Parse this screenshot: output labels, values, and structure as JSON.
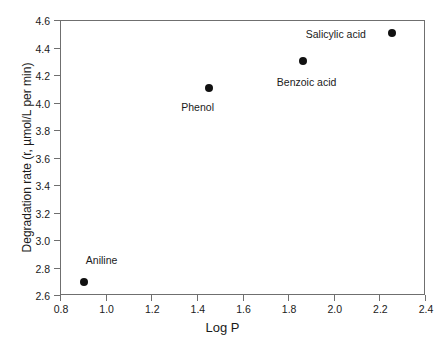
{
  "chart_data": {
    "type": "scatter",
    "title": "",
    "xlabel": "Log P",
    "ylabel": "Degradation rate (r, µmol/L per min)",
    "xlim": [
      0.8,
      2.4
    ],
    "ylim": [
      2.6,
      4.6
    ],
    "xticks": [
      "0.8",
      "1.0",
      "1.2",
      "1.4",
      "1.6",
      "1.8",
      "2.0",
      "2.2",
      "2.4"
    ],
    "xtick_values": [
      0.8,
      1.0,
      1.2,
      1.4,
      1.6,
      1.8,
      2.0,
      2.2,
      2.4
    ],
    "yticks": [
      "2.6",
      "2.8",
      "3.0",
      "3.2",
      "3.4",
      "3.6",
      "3.8",
      "4.0",
      "4.2",
      "4.4",
      "4.6"
    ],
    "ytick_values": [
      2.6,
      2.8,
      3.0,
      3.2,
      3.4,
      3.6,
      3.8,
      4.0,
      4.2,
      4.4,
      4.6
    ],
    "grid": false,
    "legend": "none",
    "marker_color": "#111111",
    "axis_color": "#6f6f6f",
    "points": [
      {
        "label": "Aniline",
        "x": 0.9,
        "y": 2.7,
        "label_dx": 2,
        "label_dy": -27
      },
      {
        "label": "Phenol",
        "x": 1.45,
        "y": 4.11,
        "label_dx": -28,
        "label_dy": 14
      },
      {
        "label": "Benzoic acid",
        "x": 1.86,
        "y": 4.31,
        "label_dx": -26,
        "label_dy": 16
      },
      {
        "label": "Salicylic acid",
        "x": 2.25,
        "y": 4.51,
        "label_dx": -86,
        "label_dy": -4
      }
    ]
  }
}
